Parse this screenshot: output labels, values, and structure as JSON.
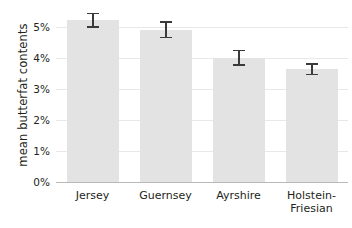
{
  "chart_data": {
    "type": "bar",
    "title": "",
    "xlabel": "",
    "ylabel": "mean butterfat contents",
    "categories": [
      "Jersey",
      "Guernsey",
      "Ayrshire",
      "Holstein-Friesian"
    ],
    "values": [
      5.2,
      4.9,
      4.0,
      3.63
    ],
    "errors": [
      0.25,
      0.28,
      0.26,
      0.2
    ],
    "error_low": [
      4.95,
      4.62,
      3.74,
      3.43
    ],
    "error_high": [
      5.45,
      5.18,
      4.26,
      3.83
    ],
    "ylim": [
      0,
      5.6
    ],
    "yticks": [
      0,
      1,
      2,
      3,
      4,
      5
    ],
    "ytick_labels": [
      "0%",
      "1%",
      "2%",
      "3%",
      "4%",
      "5%"
    ],
    "units": "percent",
    "grid": true,
    "legend": "none",
    "bar_color": "#e3e3e3",
    "errorbar_color": "#3a3a3a",
    "gridline_color": "#e8e8e8",
    "axis_color": "#b9b9b9",
    "text_color": "#231f20"
  },
  "axis": {
    "y_title": "mean butterfat contents",
    "ticks": [
      {
        "label": "5%",
        "value": 5
      },
      {
        "label": "4%",
        "value": 4
      },
      {
        "label": "3%",
        "value": 3
      },
      {
        "label": "2%",
        "value": 2
      },
      {
        "label": "1%",
        "value": 1
      },
      {
        "label": "0%",
        "value": 0
      }
    ]
  },
  "categories": [
    {
      "label": "Jersey",
      "line1": "Jersey",
      "line2": ""
    },
    {
      "label": "Guernsey",
      "line1": "Guernsey",
      "line2": ""
    },
    {
      "label": "Ayrshire",
      "line1": "Ayrshire",
      "line2": ""
    },
    {
      "label": "Holstein-Friesian",
      "line1": "Holstein-",
      "line2": "Friesian"
    }
  ]
}
